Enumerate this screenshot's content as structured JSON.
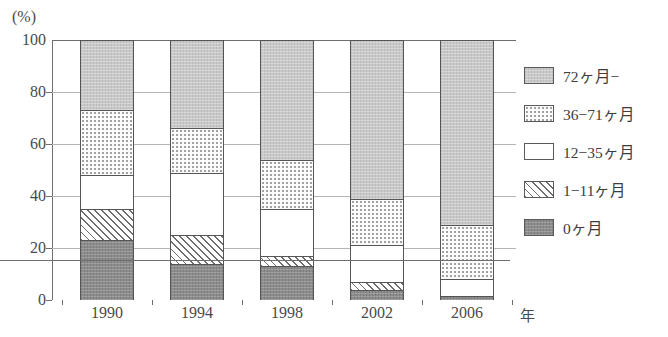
{
  "chart_data": {
    "type": "bar",
    "subtype": "stacked-100-percent",
    "title": "",
    "xlabel": "年",
    "ylabel": "",
    "unit_label": "(%)",
    "ylim": [
      0,
      100
    ],
    "yticks": [
      0,
      20,
      40,
      60,
      80,
      100
    ],
    "ytick_labels": [
      "0",
      "20",
      "40",
      "60",
      "80",
      "100"
    ],
    "grid": true,
    "grid_axis": "y",
    "legend_position": "right",
    "categories": [
      "1990",
      "1994",
      "1998",
      "2002",
      "2006"
    ],
    "series": [
      {
        "name": "0ヶ月",
        "pattern": "solid-dark-gray",
        "color": "#8c8c8c",
        "order": 0,
        "values": [
          23,
          14,
          13,
          4,
          1.5
        ]
      },
      {
        "name": "1−11ヶ月",
        "pattern": "diagonal-hatch",
        "color": "#ffffff",
        "order": 1,
        "values": [
          12,
          11,
          4,
          3,
          0
        ]
      },
      {
        "name": "12−35ヶ月",
        "pattern": "blank-white",
        "color": "#ffffff",
        "order": 2,
        "values": [
          13,
          24,
          18,
          14,
          6.5
        ]
      },
      {
        "name": "36−71ヶ月",
        "pattern": "fine-dots",
        "color": "#fbfbfb",
        "order": 3,
        "values": [
          25,
          17,
          19,
          18,
          21
        ]
      },
      {
        "name": "72ヶ月−",
        "pattern": "solid-light-gray",
        "color": "#c9c9c9",
        "order": 4,
        "values": [
          27,
          34,
          46,
          61,
          71
        ]
      }
    ],
    "cumulative_tops": {
      "1990": [
        23,
        35,
        48,
        73,
        100
      ],
      "1994": [
        14,
        25,
        49,
        66,
        100
      ],
      "1998": [
        13,
        17,
        35,
        54,
        100
      ],
      "2002": [
        4,
        7,
        21,
        39,
        100
      ],
      "2006": [
        1.5,
        1.5,
        8,
        29,
        100
      ]
    }
  },
  "legend": {
    "items": [
      {
        "label": "72ヶ月−",
        "swatch": "solid-light-gray"
      },
      {
        "label": "36−71ヶ月",
        "swatch": "fine-dots"
      },
      {
        "label": "12−35ヶ月",
        "swatch": "blank-white"
      },
      {
        "label": "1−11ヶ月",
        "swatch": "diagonal-hatch"
      },
      {
        "label": "0ヶ月",
        "swatch": "solid-dark-gray"
      }
    ]
  }
}
